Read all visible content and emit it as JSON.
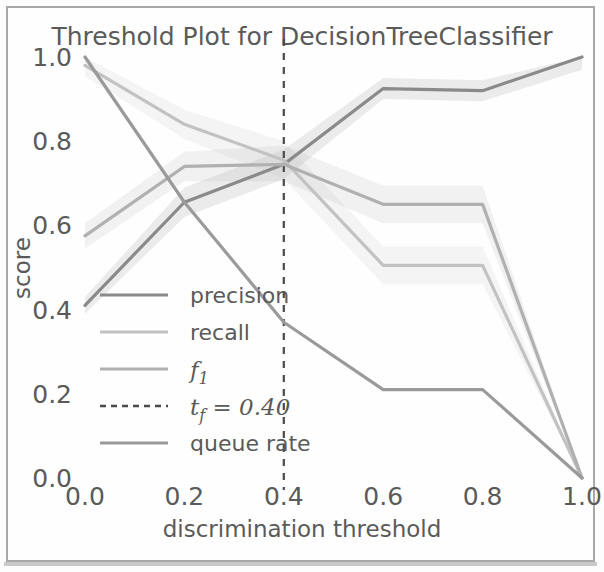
{
  "chart_data": {
    "type": "line",
    "title": "Threshold Plot for DecisionTreeClassifier",
    "xlabel": "discrimination threshold",
    "ylabel": "score",
    "xlim": [
      0.0,
      1.0
    ],
    "ylim": [
      0.0,
      1.0
    ],
    "xticks": [
      "0.0",
      "0.2",
      "0.4",
      "0.6",
      "0.8",
      "1.0"
    ],
    "xtick_values": [
      0.0,
      0.2,
      0.4,
      0.6,
      0.8,
      1.0
    ],
    "yticks": [
      "0.0",
      "0.2",
      "0.4",
      "0.6",
      "0.8",
      "1.0"
    ],
    "ytick_values": [
      0.0,
      0.2,
      0.4,
      0.6,
      0.8,
      1.0
    ],
    "grid": false,
    "legend_position": "lower left",
    "x": [
      0.0,
      0.2,
      0.4,
      0.6,
      0.8,
      1.0
    ],
    "series": [
      {
        "name": "precision",
        "label": "precision",
        "color": "#8a8a8a",
        "values": [
          0.41,
          0.655,
          0.745,
          0.925,
          0.92,
          1.0
        ],
        "band_lower": [
          0.39,
          0.62,
          0.71,
          0.9,
          0.895,
          0.97
        ],
        "band_upper": [
          0.43,
          0.69,
          0.78,
          0.95,
          0.945,
          1.0
        ]
      },
      {
        "name": "recall",
        "label": "recall",
        "color": "#c2c2c2",
        "values": [
          0.98,
          0.84,
          0.755,
          0.505,
          0.505,
          0.0
        ],
        "band_lower": [
          0.955,
          0.805,
          0.71,
          0.46,
          0.46,
          0.0
        ],
        "band_upper": [
          1.0,
          0.875,
          0.8,
          0.55,
          0.55,
          0.0
        ]
      },
      {
        "name": "f1",
        "label": "f1",
        "color": "#b0b0b0",
        "values": [
          0.575,
          0.74,
          0.745,
          0.65,
          0.65,
          0.0
        ],
        "band_lower": [
          0.545,
          0.705,
          0.705,
          0.605,
          0.605,
          0.0
        ],
        "band_upper": [
          0.605,
          0.775,
          0.79,
          0.695,
          0.695,
          0.0
        ]
      },
      {
        "name": "queue-rate",
        "label": "queue rate",
        "color": "#9a9a9a",
        "values": [
          1.0,
          0.655,
          0.37,
          0.21,
          0.21,
          0.0
        ],
        "band_lower": [
          1.0,
          0.655,
          0.37,
          0.21,
          0.21,
          0.0
        ],
        "band_upper": [
          1.0,
          0.655,
          0.37,
          0.21,
          0.21,
          0.0
        ]
      }
    ],
    "threshold": {
      "name": "t_f",
      "label": "t_f = 0.40",
      "label_prefix": "t",
      "label_subscript": "f",
      "label_suffix": "= 0.40",
      "value": 0.4,
      "color": "#4a4a4a",
      "style": "dashed"
    }
  },
  "legend": {
    "items": [
      {
        "label": "precision",
        "color": "#8a8a8a",
        "style": "solid",
        "italic": false
      },
      {
        "label": "recall",
        "color": "#c2c2c2",
        "style": "solid",
        "italic": false
      },
      {
        "label": "f1",
        "color": "#b0b0b0",
        "style": "solid",
        "italic": true
      },
      {
        "label": "t_f = 0.40",
        "color": "#4a4a4a",
        "style": "dashed",
        "italic": true
      },
      {
        "label": "queue rate",
        "color": "#9a9a9a",
        "style": "solid",
        "italic": false
      }
    ]
  },
  "colors": {
    "background": "#fefefe",
    "frame": "#a8a8a8",
    "text": "#5a5a5a"
  }
}
